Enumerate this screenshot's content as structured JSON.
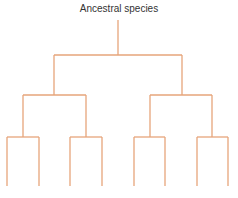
{
  "diagram": {
    "title": "Ancestral species",
    "line_color": "#e6a57a",
    "root": {
      "x": 118,
      "y_top": 20,
      "y_bottom": 55
    },
    "levels": [
      {
        "y": 55,
        "children_x": [
          54,
          182
        ]
      },
      {
        "y": 95,
        "groups": [
          {
            "parent_x": 54,
            "children_x": [
              23,
              86
            ]
          },
          {
            "parent_x": 182,
            "children_x": [
              150,
              212
            ]
          }
        ]
      },
      {
        "y": 137,
        "groups": [
          {
            "parent_x": 23,
            "children_x": [
              7,
              39
            ]
          },
          {
            "parent_x": 86,
            "children_x": [
              70,
              102
            ]
          },
          {
            "parent_x": 150,
            "children_x": [
              134,
              165
            ]
          },
          {
            "parent_x": 212,
            "children_x": [
              197,
              228
            ]
          }
        ]
      }
    ],
    "leaf_y": 186
  }
}
